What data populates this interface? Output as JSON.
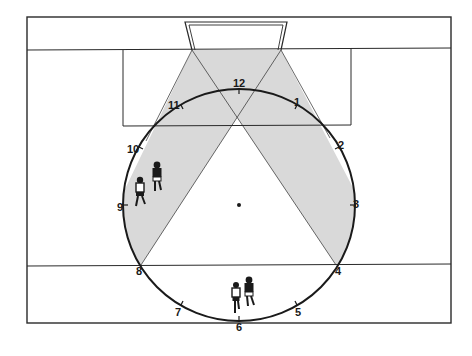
{
  "diagram": {
    "title": "",
    "colors": {
      "line": "#2a2a2a",
      "shade": "#d9d9d9",
      "background": "#ffffff"
    },
    "clock_labels": [
      {
        "id": "12",
        "text": "12",
        "x": 233,
        "y": 87
      },
      {
        "id": "1",
        "text": "1",
        "x": 294,
        "y": 106
      },
      {
        "id": "2",
        "text": "2",
        "x": 338,
        "y": 149
      },
      {
        "id": "3",
        "text": "3",
        "x": 353,
        "y": 208
      },
      {
        "id": "4",
        "text": "4",
        "x": 335,
        "y": 275
      },
      {
        "id": "5",
        "text": "5",
        "x": 295,
        "y": 316
      },
      {
        "id": "6",
        "text": "6",
        "x": 236,
        "y": 331
      },
      {
        "id": "7",
        "text": "7",
        "x": 175,
        "y": 316
      },
      {
        "id": "8",
        "text": "8",
        "x": 136,
        "y": 275
      },
      {
        "id": "9",
        "text": "9",
        "x": 117,
        "y": 211
      },
      {
        "id": "10",
        "text": "10",
        "x": 127,
        "y": 153
      },
      {
        "id": "11",
        "text": "11",
        "x": 168,
        "y": 109
      }
    ],
    "players": [
      {
        "id": "player-left-1",
        "label": "player",
        "x": 140,
        "y": 190
      },
      {
        "id": "player-left-2",
        "label": "player",
        "x": 157,
        "y": 175
      },
      {
        "id": "player-bottom-1",
        "label": "player",
        "x": 236,
        "y": 295
      },
      {
        "id": "player-bottom-2",
        "label": "player",
        "x": 249,
        "y": 290
      }
    ],
    "center_spot": {
      "x": 239,
      "y": 205
    }
  }
}
